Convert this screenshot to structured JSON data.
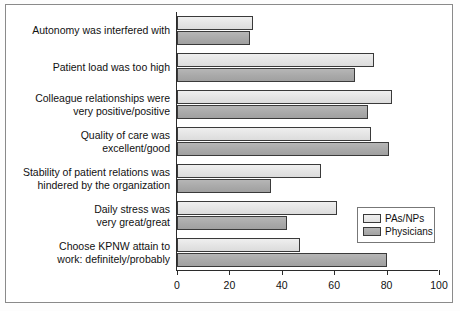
{
  "chart_data": {
    "type": "bar",
    "orientation": "horizontal",
    "title": "",
    "xlabel": "",
    "ylabel": "",
    "xlim": [
      0,
      100
    ],
    "xticks": [
      0,
      20,
      40,
      60,
      80,
      100
    ],
    "grid": false,
    "legend_position": "inside-right-lower",
    "categories": [
      "Autonomy was interfered with",
      "Patient load was too high",
      "Colleague relationships were\nvery positive/positive",
      "Quality of care was\nexcellent/good",
      "Stability of patient relations was\nhindered by the organization",
      "Daily stress was\nvery great/great",
      "Choose KPNW attain to\nwork: definitely/probably"
    ],
    "series": [
      {
        "name": "PAs/NPs",
        "color": "#e4e4e4",
        "values": [
          29,
          75,
          82,
          74,
          55,
          61,
          47
        ]
      },
      {
        "name": "Physicians",
        "color": "#a9a9a9",
        "values": [
          28,
          68,
          73,
          81,
          36,
          42,
          80
        ]
      }
    ]
  },
  "legend": {
    "items": [
      {
        "label": "PAs/NPs",
        "swatch": "light"
      },
      {
        "label": "Physicians",
        "swatch": "dark"
      }
    ]
  }
}
